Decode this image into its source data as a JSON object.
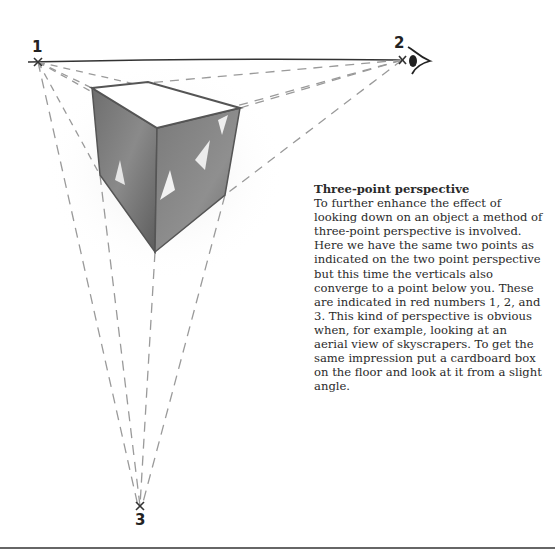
{
  "diagram": {
    "vanishing_points": [
      {
        "label": "1",
        "x": 38,
        "y": 62
      },
      {
        "label": "2",
        "x": 402,
        "y": 60
      },
      {
        "label": "3",
        "x": 140,
        "y": 506
      }
    ],
    "eye_icon": "eye-icon"
  },
  "caption": {
    "title": "Three-point perspective",
    "body": "To further enhance the effect of looking down on an object a method of three-point perspective is involved. Here we have the same two points as indicated on the two point perspective but this time the verticals also converge to a point below you. These are indicated in red numbers 1, 2, and 3. This kind of perspective is obvious when, for example, looking at an aerial view of skyscrapers. To get the same impression put a cardboard box on the floor and look at it from a slight angle."
  }
}
